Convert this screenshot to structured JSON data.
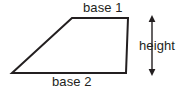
{
  "diagram": {
    "shape": "trapezoid",
    "background_color": "#ffffff",
    "stroke_color": "#231f20",
    "text_color": "#231f20",
    "stroke_width": 2,
    "labels": {
      "base1": "base 1",
      "base2": "base 2",
      "height": "height"
    },
    "vertices": [
      {
        "name": "top-left",
        "x": 72,
        "y": 18
      },
      {
        "name": "top-right",
        "x": 128,
        "y": 18
      },
      {
        "name": "bottom-right",
        "x": 126,
        "y": 73
      },
      {
        "name": "bottom-left",
        "x": 12,
        "y": 73
      }
    ],
    "height_arrow": {
      "x": 152,
      "y_top": 17,
      "y_bottom": 74,
      "double_headed": true
    }
  }
}
